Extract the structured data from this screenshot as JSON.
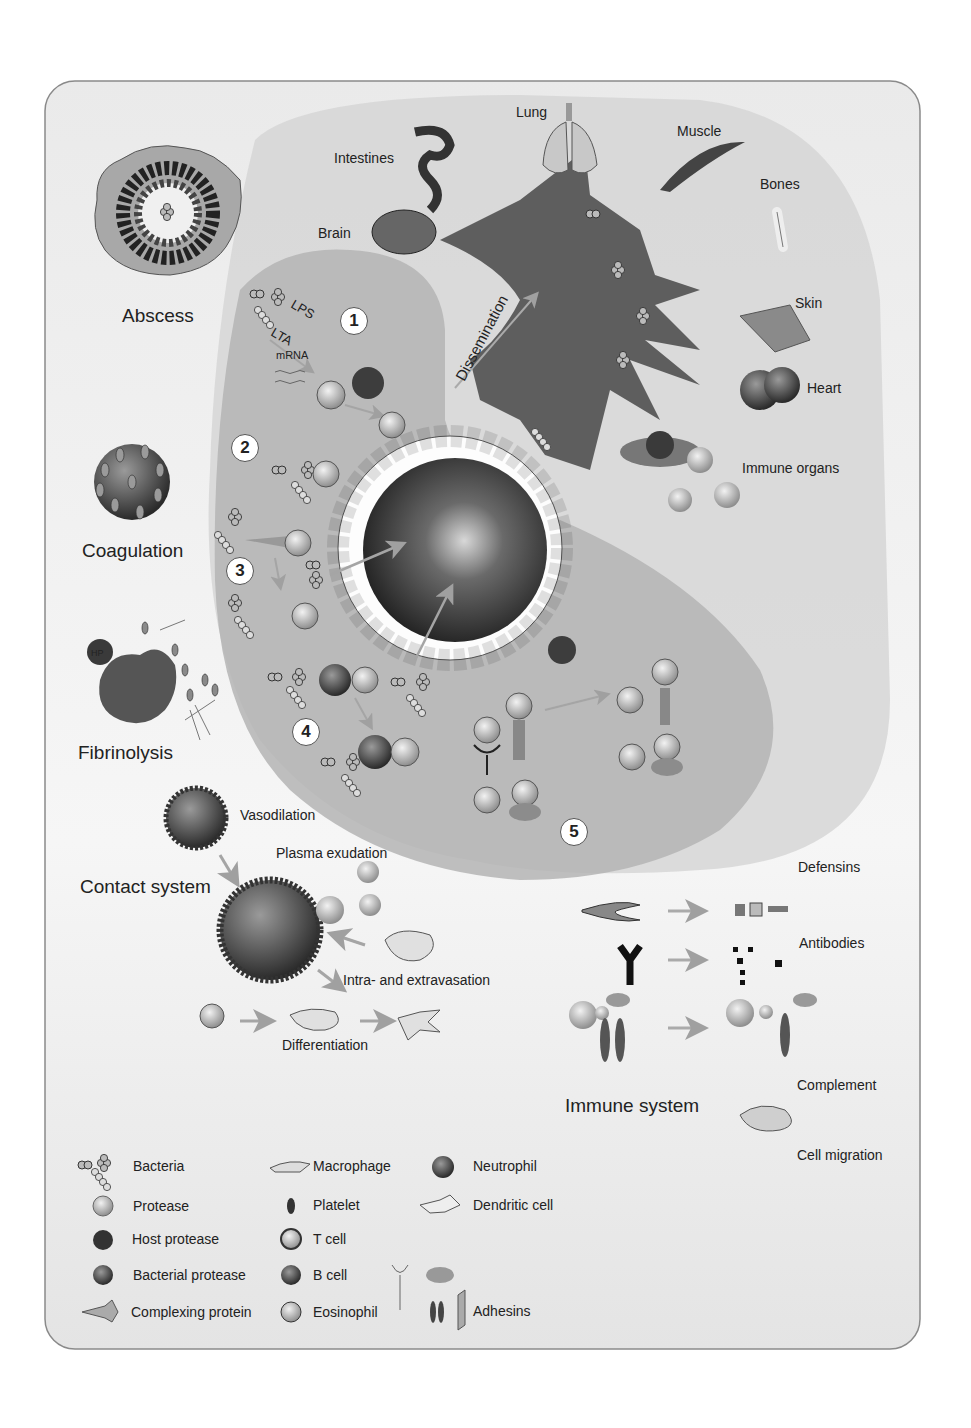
{
  "figure": {
    "frame": {
      "background": "#e9e9e9",
      "border": "#888888"
    },
    "colors": {
      "light_zone": "#d4d4d4",
      "mid_zone": "#b9b9b9",
      "vessel_dark": "#3a3a3a",
      "tissue": "#5e5e5e",
      "arrow": "#a8a8a8",
      "white": "#ffffff"
    }
  },
  "left_labels": {
    "abscess": "Abscess",
    "coagulation": "Coagulation",
    "fibrinolysis": "Fibrinolysis",
    "contact_system": "Contact system"
  },
  "organs": {
    "intestines": "Intestines",
    "lung": "Lung",
    "muscle": "Muscle",
    "brain": "Brain",
    "bones": "Bones",
    "skin": "Skin",
    "heart": "Heart",
    "immune_organs": "Immune organs"
  },
  "process": {
    "dissemination": "Dissemination",
    "lps": "LPS",
    "lta": "LTA",
    "mrna": "mRNA",
    "steps": [
      "1",
      "2",
      "3",
      "4",
      "5"
    ],
    "p": "P",
    "hp": "HP",
    "pc": "PC",
    "bp": "BP"
  },
  "contact_system": {
    "vasodilation": "Vasodilation",
    "plasma_exudation": "Plasma exudation",
    "intra_extravasation": "Intra- and extravasation",
    "differentiation": "Differentiation"
  },
  "immune_system": {
    "title": "Immune system",
    "defensins": "Defensins",
    "antibodies": "Antibodies",
    "complement": "Complement",
    "cell_migration": "Cell migration"
  },
  "legend": {
    "col1": [
      "Bacteria",
      "Protease",
      "Host protease",
      "Bacterial protease",
      "Complexing protein"
    ],
    "col2": [
      "Macrophage",
      "Platelet",
      "T cell",
      "B cell",
      "Eosinophil"
    ],
    "col3": [
      "Neutrophil",
      "Dendritic cell",
      "Adhesins"
    ]
  }
}
